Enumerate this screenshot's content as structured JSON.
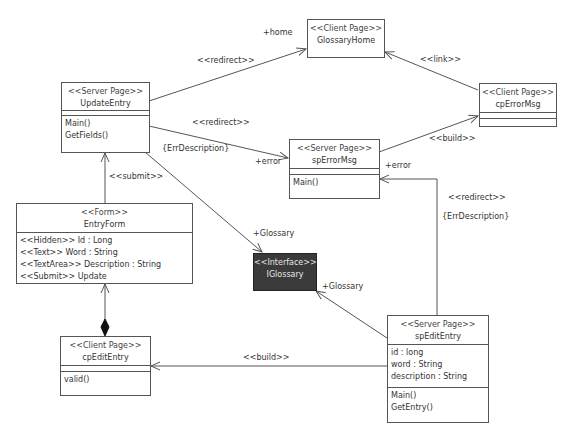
{
  "nodes": {
    "update_entry": {
      "stereotype": "<<Server Page>>",
      "name": "UpdateEntry",
      "attributes": [],
      "methods": [
        "Main()",
        "GetFields()"
      ]
    },
    "glossary_home": {
      "stereotype": "<<Client Page>>",
      "name": "GlossaryHome"
    },
    "cp_error_msg": {
      "stereotype": "<<Client Page>>",
      "name": "cpErrorMsg"
    },
    "sp_error_msg": {
      "stereotype": "<<Server Page>>",
      "name": "spErrorMsg",
      "methods": [
        "Main()"
      ]
    },
    "iglossary": {
      "stereotype": "<<Interface>>",
      "name": "IGlossary"
    },
    "entry_form": {
      "stereotype": "<<Form>>",
      "name": "EntryForm",
      "attributes": [
        "<<Hidden>> Id : Long",
        "<<Text>> Word : String",
        "<<TextArea>> Description : String",
        "<<Submit>> Update"
      ]
    },
    "cp_edit_entry": {
      "stereotype": "<<Client Page>>",
      "name": "cpEditEntry",
      "methods": [
        "valid()"
      ]
    },
    "sp_edit_entry": {
      "stereotype": "<<Server Page>>",
      "name": "spEditEntry",
      "attributes": [
        "id : long",
        "word : String",
        "description : String"
      ],
      "methods": [
        "Main()",
        "GetEntry()"
      ]
    }
  },
  "labels": {
    "home_role": "+home",
    "redirect_home": "<<redirect>>",
    "link": "<<link>>",
    "redirect_error": "<<redirect>>",
    "err_desc_1": "{ErrDescription}",
    "error_role_1": "+error",
    "build_error": "<<build>>",
    "error_role_2": "+error",
    "redirect_edit": "<<redirect>>",
    "err_desc_2": "{ErrDescription}",
    "submit": "<<submit>>",
    "glossary_role_1": "+Glossary",
    "glossary_role_2": "+Glossary",
    "build_edit": "<<build>>"
  },
  "colors": {
    "line": "#555555",
    "interface_fill": "#3b3b3b",
    "interface_text": "#e8e8e8"
  }
}
